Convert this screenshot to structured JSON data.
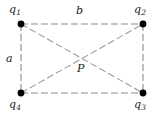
{
  "figure": {
    "type": "physics-diagram",
    "width": 163,
    "height": 117,
    "background_color": "#ffffff",
    "line_color": "#8c8c8c",
    "dot_color": "#000000",
    "text_color": "#1a1a1a",
    "dash_pattern": "7 3",
    "charges": [
      {
        "id": "q1",
        "base": "q",
        "sub": "1",
        "x": 21,
        "y": 24,
        "corner": "top-left"
      },
      {
        "id": "q2",
        "base": "q",
        "sub": "2",
        "x": 143,
        "y": 24,
        "corner": "top-right"
      },
      {
        "id": "q3",
        "base": "q",
        "sub": "3",
        "x": 143,
        "y": 93,
        "corner": "bottom-right"
      },
      {
        "id": "q4",
        "base": "q",
        "sub": "4",
        "x": 21,
        "y": 93,
        "corner": "bottom-left"
      }
    ],
    "side_labels": {
      "vertical": "a",
      "horizontal": "b"
    },
    "center_point": {
      "label": "P",
      "x": 82,
      "y": 58.5
    },
    "edges": [
      {
        "name": "top",
        "from": "q1",
        "to": "q2",
        "label": "b"
      },
      {
        "name": "right",
        "from": "q2",
        "to": "q3",
        "label": ""
      },
      {
        "name": "bottom",
        "from": "q4",
        "to": "q3",
        "label": ""
      },
      {
        "name": "left",
        "from": "q1",
        "to": "q4",
        "label": "a"
      }
    ],
    "diagonals": [
      {
        "name": "diagonal-q1-q3",
        "from": "q1",
        "to": "q3"
      },
      {
        "name": "diagonal-q4-q2",
        "from": "q4",
        "to": "q2"
      }
    ]
  }
}
